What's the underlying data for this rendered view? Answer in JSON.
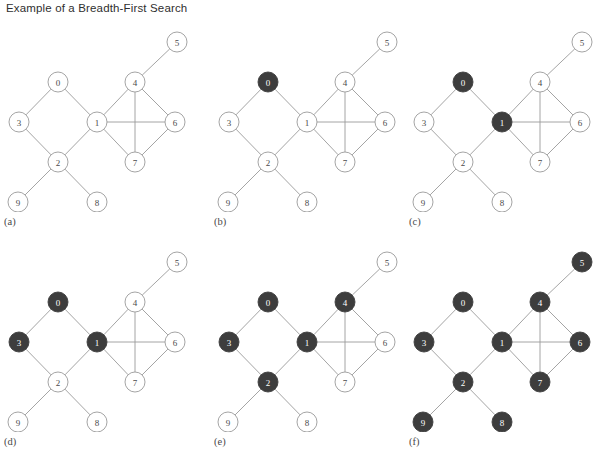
{
  "figure": {
    "title": "Example of a Breadth-First Search",
    "width": 605,
    "height": 454,
    "node_fill_color": "#3d3d3d",
    "node_empty_color": "#ffffff",
    "edge_color": "#9a9a9a",
    "text_color": "#4a4a4a"
  },
  "graph": {
    "nodes": [
      {
        "id": "0",
        "label": "0",
        "x": 58,
        "y": 70
      },
      {
        "id": "1",
        "label": "1",
        "x": 97,
        "y": 110
      },
      {
        "id": "2",
        "label": "2",
        "x": 58,
        "y": 150
      },
      {
        "id": "3",
        "label": "3",
        "x": 19,
        "y": 110
      },
      {
        "id": "4",
        "label": "4",
        "x": 135,
        "y": 70
      },
      {
        "id": "5",
        "label": "5",
        "x": 177,
        "y": 30
      },
      {
        "id": "6",
        "label": "6",
        "x": 175,
        "y": 110
      },
      {
        "id": "7",
        "label": "7",
        "x": 135,
        "y": 150
      },
      {
        "id": "8",
        "label": "8",
        "x": 97,
        "y": 190
      },
      {
        "id": "9",
        "label": "9",
        "x": 18,
        "y": 190
      }
    ],
    "node_radius": 10,
    "edges": [
      [
        "0",
        "3"
      ],
      [
        "0",
        "1"
      ],
      [
        "3",
        "2"
      ],
      [
        "2",
        "1"
      ],
      [
        "2",
        "9"
      ],
      [
        "2",
        "8"
      ],
      [
        "1",
        "4"
      ],
      [
        "1",
        "6"
      ],
      [
        "1",
        "7"
      ],
      [
        "4",
        "5"
      ],
      [
        "4",
        "6"
      ],
      [
        "4",
        "7"
      ],
      [
        "6",
        "7"
      ]
    ]
  },
  "panels": [
    {
      "id": "a",
      "label": "(a)",
      "left": 0,
      "top": 12,
      "visited": []
    },
    {
      "id": "b",
      "label": "(b)",
      "left": 210,
      "top": 12,
      "visited": [
        "0"
      ]
    },
    {
      "id": "c",
      "label": "(c)",
      "left": 405,
      "top": 12,
      "visited": [
        "0",
        "1"
      ]
    },
    {
      "id": "d",
      "label": "(d)",
      "left": 0,
      "top": 232,
      "visited": [
        "0",
        "1",
        "3"
      ]
    },
    {
      "id": "e",
      "label": "(e)",
      "left": 210,
      "top": 232,
      "visited": [
        "0",
        "1",
        "2",
        "3",
        "4"
      ]
    },
    {
      "id": "f",
      "label": "(f)",
      "left": 405,
      "top": 232,
      "visited": [
        "0",
        "1",
        "2",
        "3",
        "4",
        "5",
        "6",
        "7",
        "8",
        "9"
      ]
    }
  ]
}
